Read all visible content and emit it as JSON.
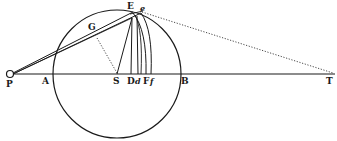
{
  "figure": {
    "type": "geometric-diagram",
    "stroke_color": "#1a1a1a",
    "background": "#ffffff",
    "points": {
      "P": {
        "label": "P",
        "x": 11,
        "y": 74
      },
      "A": {
        "label": "A",
        "x": 52,
        "y": 74
      },
      "S": {
        "label": "S",
        "x": 117,
        "y": 74
      },
      "D": {
        "label": "D",
        "x": 131,
        "y": 74
      },
      "d": {
        "label": "d",
        "x": 138,
        "y": 74
      },
      "F": {
        "label": "F",
        "x": 146,
        "y": 74
      },
      "f": {
        "label": "f",
        "x": 151,
        "y": 74
      },
      "B": {
        "label": "B",
        "x": 181,
        "y": 74
      },
      "T": {
        "label": "T",
        "x": 333,
        "y": 74
      },
      "E": {
        "label": "E",
        "x": 133,
        "y": 12
      },
      "e": {
        "label": "e",
        "x": 141,
        "y": 12
      },
      "G": {
        "label": "G",
        "x": 97,
        "y": 37
      }
    },
    "labels": {
      "P": "P",
      "A": "A",
      "S": "S",
      "D": "D",
      "d": "d",
      "F": "F",
      "f": "f",
      "B": "B",
      "T": "T",
      "E": "E",
      "e": "e",
      "G": "G"
    },
    "circle": {
      "center": "S",
      "cx": 117,
      "cy": 74,
      "r": 64
    }
  }
}
